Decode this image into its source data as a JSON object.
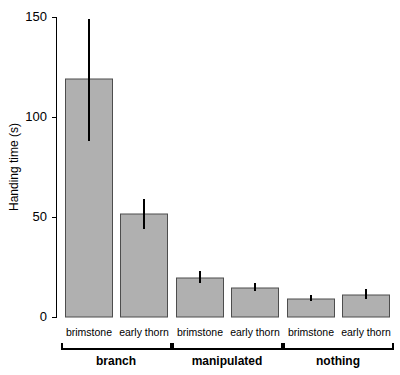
{
  "chart_data": {
    "type": "bar",
    "title": "",
    "xlabel": "",
    "ylabel": "Handing time (s)",
    "ylim": [
      0,
      150
    ],
    "yticks": [
      0,
      50,
      100,
      150
    ],
    "ytick_labels": [
      "0",
      "50",
      "100",
      "150"
    ],
    "grid": false,
    "legend": "none",
    "categories": [
      "brimstone",
      "early thorn",
      "brimstone",
      "early thorn",
      "brimstone",
      "early thorn"
    ],
    "groups": [
      {
        "label": "branch",
        "members": [
          "brimstone",
          "early thorn"
        ]
      },
      {
        "label": "manipulated",
        "members": [
          "brimstone",
          "early thorn"
        ]
      },
      {
        "label": "nothing",
        "members": [
          "brimstone",
          "early thorn"
        ]
      }
    ],
    "values": [
      119,
      51.5,
      19.5,
      14.5,
      9,
      11
    ],
    "errors_upper": [
      149,
      59,
      23,
      17,
      11,
      14
    ],
    "errors_lower": [
      88,
      44,
      17,
      13,
      8,
      9
    ],
    "bar_color": "#b0b0b0",
    "bar_edge_color": "#4d4d4d",
    "error_color": "#000000"
  },
  "axis": {
    "y_title": "Handing time (s)",
    "tick_0": "0",
    "tick_50": "50",
    "tick_100": "100",
    "tick_150": "150"
  },
  "bars": [
    {
      "name": "branch-brimstone",
      "category": "brimstone",
      "group": "branch",
      "value": 119,
      "err_hi": 149,
      "err_lo": 88
    },
    {
      "name": "branch-early-thorn",
      "category": "early thorn",
      "group": "branch",
      "value": 51.5,
      "err_hi": 59,
      "err_lo": 44
    },
    {
      "name": "manipulated-brimstone",
      "category": "brimstone",
      "group": "manipulated",
      "value": 19.5,
      "err_hi": 23,
      "err_lo": 17
    },
    {
      "name": "manipulated-early-thorn",
      "category": "early thorn",
      "group": "manipulated",
      "value": 14.5,
      "err_hi": 17,
      "err_lo": 13
    },
    {
      "name": "nothing-brimstone",
      "category": "brimstone",
      "group": "nothing",
      "value": 9,
      "err_hi": 11,
      "err_lo": 8
    },
    {
      "name": "nothing-early-thorn",
      "category": "early thorn",
      "group": "nothing",
      "value": 11,
      "err_hi": 14,
      "err_lo": 9
    }
  ],
  "group_labels": [
    "branch",
    "manipulated",
    "nothing"
  ],
  "category_labels": [
    "brimstone",
    "early thorn",
    "brimstone",
    "early thorn",
    "brimstone",
    "early thorn"
  ]
}
